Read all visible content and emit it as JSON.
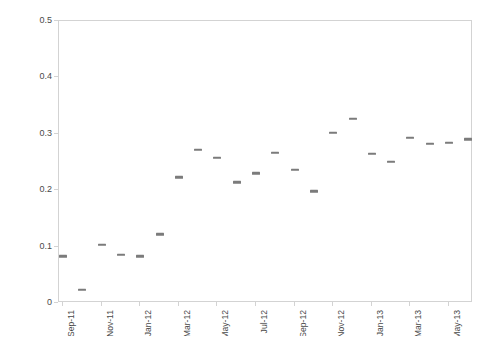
{
  "chart_data": {
    "type": "scatter",
    "title": "",
    "xlabel": "",
    "ylabel": "Blog views (proportion of total website views)",
    "ylim": [
      0,
      0.5
    ],
    "ytick_values": [
      0,
      0.1,
      0.2,
      0.3,
      0.4,
      0.5
    ],
    "ytick_labels": [
      "0",
      "0.1",
      "0.2",
      "0.3",
      "0.4",
      "0.5"
    ],
    "xtick_labels": [
      "Sep-11",
      "Nov-11",
      "Jan-12",
      "Mar-12",
      "May-12",
      "Jul-12",
      "Sep-12",
      "Nov-12",
      "Jan-13",
      "Mar-13",
      "May-13"
    ],
    "grid": false,
    "legend": false,
    "marker_color": "#7b7b7b",
    "axis_color": "#d3d3d3",
    "text_color": "#4a4a4a",
    "x": [
      "Sep-11",
      "Oct-11",
      "Nov-11",
      "Dec-11",
      "Jan-12",
      "Feb-12",
      "Mar-12",
      "Apr-12",
      "May-12",
      "Jun-12",
      "Jul-12",
      "Aug-12",
      "Sep-12",
      "Oct-12",
      "Nov-12",
      "Dec-12",
      "Jan-13",
      "Feb-13",
      "Mar-13",
      "Apr-13",
      "May-13",
      "Jun-13"
    ],
    "values": [
      0.083,
      0.023,
      0.103,
      0.085,
      0.083,
      0.122,
      0.223,
      0.272,
      0.257,
      0.214,
      0.23,
      0.266,
      0.236,
      0.198,
      0.302,
      0.327,
      0.264,
      0.25,
      0.293,
      0.282,
      0.284,
      0.29
    ]
  }
}
